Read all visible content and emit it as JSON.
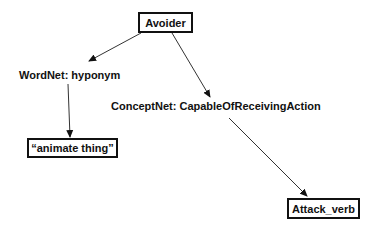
{
  "diagram": {
    "nodes": {
      "root": {
        "label": "Avoider"
      },
      "wordnet_target": {
        "label": "“animate thing”"
      },
      "conceptnet_target": {
        "label": "Attack_verb"
      }
    },
    "relations": {
      "wordnet": {
        "label": "WordNet: hyponym"
      },
      "conceptnet": {
        "label": "ConceptNet: CapableOfReceivingAction"
      }
    },
    "edges": [
      {
        "from": "Avoider",
        "to": "WordNet: hyponym"
      },
      {
        "from": "Avoider",
        "to": "ConceptNet: CapableOfReceivingAction"
      },
      {
        "from": "WordNet: hyponym",
        "to": "“animate thing”"
      },
      {
        "from": "ConceptNet: CapableOfReceivingAction",
        "to": "Attack_verb"
      }
    ],
    "colors": {
      "line": "#333333",
      "border": "#111111",
      "background": "#ffffff"
    }
  }
}
